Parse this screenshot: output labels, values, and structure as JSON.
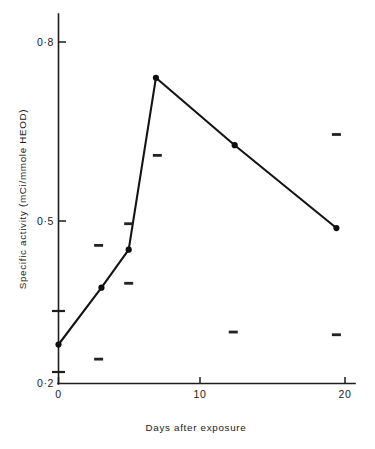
{
  "chart_data": {
    "type": "line",
    "title": "",
    "xlabel": "Days after exposure",
    "ylabel": "Specific activity (mCi/mmole HEOD)",
    "xlim": [
      0,
      20.5
    ],
    "ylim": [
      0.2,
      0.85
    ],
    "grid": false,
    "legend": "none",
    "x_tick_labels": [
      "0",
      "10",
      "20"
    ],
    "x_tick_values": [
      0,
      10,
      20
    ],
    "y_tick_labels": [
      "0·2",
      "0·5",
      "0·8"
    ],
    "y_tick_values": [
      0.2,
      0.5,
      0.8
    ],
    "y_minor_tick_values": [
      0.235,
      0.285,
      0.5,
      0.8
    ],
    "series": [
      {
        "name": "Specific activity",
        "marker": "filled-circle",
        "x": [
          0,
          3.0,
          4.9,
          6.8,
          12.3,
          19.4
        ],
        "y": [
          0.272,
          0.377,
          0.447,
          0.74,
          0.627,
          0.487
        ]
      }
    ],
    "annotations": [
      {
        "name": "speck",
        "x": 6.9,
        "y": 0.885
      },
      {
        "name": "speck",
        "x": 12.2,
        "y": 0.905
      },
      {
        "name": "speck",
        "x": 6.9,
        "y": 0.61
      },
      {
        "name": "speck",
        "x": 19.4,
        "y": 0.645
      },
      {
        "name": "speck",
        "x": 4.9,
        "y": 0.495
      },
      {
        "name": "speck",
        "x": 2.8,
        "y": 0.455
      },
      {
        "name": "speck",
        "x": 4.9,
        "y": 0.385
      },
      {
        "name": "speck",
        "x": 12.2,
        "y": 0.295
      },
      {
        "name": "speck",
        "x": 19.4,
        "y": 0.29
      },
      {
        "name": "speck",
        "x": 2.8,
        "y": 0.245
      }
    ]
  },
  "axis": {
    "x_title": "Days after exposure",
    "y_title": "Specific activity (mCi/mmole HEOD)",
    "x_labels": [
      "0",
      "10",
      "20"
    ],
    "y_labels": [
      "0·2",
      "0·5",
      "0·8"
    ]
  },
  "colors": {
    "ink": "#1a1a1a",
    "line": "#141414",
    "marker": "#0f0f0f",
    "background": "#ffffff"
  }
}
